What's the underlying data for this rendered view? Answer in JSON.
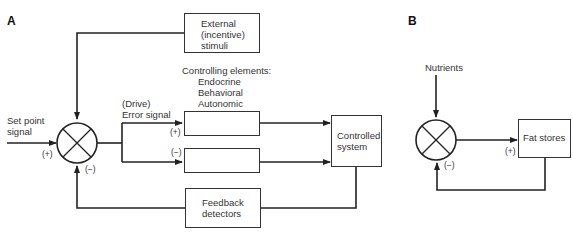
{
  "panel_a": {
    "label": "A",
    "external_stimuli": [
      "External",
      "(incentive)",
      "stimuli"
    ],
    "controlling_elements": [
      "Controlling elements:",
      "Endocrine",
      "Behavioral",
      "Autonomic"
    ],
    "error_signal": [
      "(Drive)",
      "Error signal"
    ],
    "set_point": [
      "Set point",
      "signal"
    ],
    "set_point_sign": "(+)",
    "feedback_sign": "(−)",
    "upper_branch_sign": "(+)",
    "lower_branch_sign": "(−)",
    "controlled_system": [
      "Controlled",
      "system"
    ],
    "feedback_detectors": [
      "Feedback",
      "detectors"
    ]
  },
  "panel_b": {
    "label": "B",
    "nutrients": "Nutrients",
    "fat_stores": "Fat stores",
    "input_sign": "(+)",
    "feedback_sign": "(−)"
  }
}
